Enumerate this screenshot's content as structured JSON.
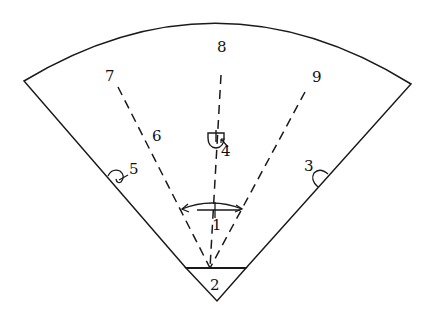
{
  "diagram": {
    "type": "sector-field-layout",
    "labels": {
      "l1": "1",
      "l2": "2",
      "l3": "3",
      "l4": "4",
      "l5": "5",
      "l6": "6",
      "l7": "7",
      "l8": "8",
      "l9": "9"
    },
    "colors": {
      "line": "#1a1a1a",
      "background": "#ffffff"
    }
  }
}
